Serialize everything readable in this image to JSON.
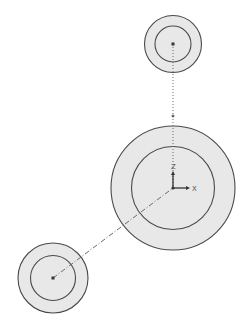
{
  "canvas": {
    "width": 249,
    "height": 333,
    "background": "#ffffff"
  },
  "colors": {
    "stroke": "#4a4a4a",
    "fill": "#e8e8e8",
    "construction": "#6a6a6a",
    "origin": "#333333"
  },
  "origin": {
    "x": 173,
    "y": 188,
    "axis_labels": {
      "x": "X",
      "z": "Z"
    }
  },
  "circles": [
    {
      "id": "top",
      "cx": 173,
      "cy": 44,
      "r_outer": 28.5,
      "r_inner": 18
    },
    {
      "id": "center",
      "cx": 173,
      "cy": 188,
      "r_outer": 62,
      "r_inner": 41.5
    },
    {
      "id": "bottom-left",
      "cx": 53,
      "cy": 278,
      "r_outer": 35,
      "r_inner": 22.5
    }
  ],
  "construction_lines": [
    {
      "id": "vertical",
      "x1": 173,
      "y1": 44,
      "x2": 173,
      "y2": 188,
      "style": "dotted"
    },
    {
      "id": "diagonal",
      "x1": 53,
      "y1": 278,
      "x2": 173,
      "y2": 188,
      "style": "dashdot"
    }
  ],
  "midpoint": {
    "x": 173,
    "y": 116
  }
}
